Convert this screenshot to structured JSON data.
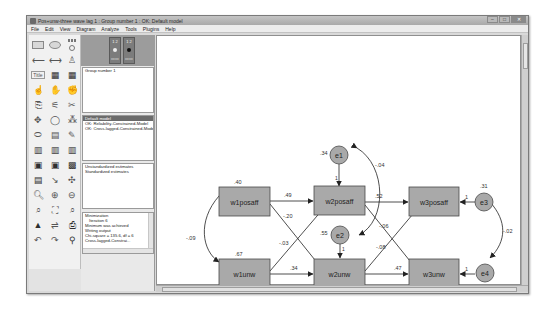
{
  "window": {
    "title": "Pos+unw-three wave lag 1 : Group number 1 : OK: Default model",
    "controls": [
      "minimize",
      "maximize",
      "close"
    ]
  },
  "menubar": {
    "items": [
      "File",
      "Edit",
      "View",
      "Diagram",
      "Analyze",
      "Tools",
      "Plugins",
      "Help"
    ]
  },
  "toolbox": {
    "tools": [
      "draw-observed-variable-icon",
      "draw-unobserved-variable-icon",
      "draw-indicator-icon",
      "draw-path-icon",
      "draw-covariance-icon",
      "add-unique-variable-icon",
      "list-variables-in-model-icon",
      "list-variables-in-dataset-icon",
      "select-one-object-icon",
      "select-all-icon",
      "deselect-all-icon",
      "duplicate-icon",
      "move-icon",
      "erase-icon",
      "change-shape-icon",
      "rotate-icon",
      "reflect-icon",
      "move-parameter-icon",
      "scroll-icon",
      "touch-up-icon",
      "data-files-icon",
      "analysis-properties-icon",
      "calculate-estimates-icon",
      "copy-to-clipboard-icon",
      "text-output-icon",
      "save-icon",
      "object-properties-icon",
      "drag-properties-icon",
      "preserve-symmetries-icon",
      "zoom-in-area-icon",
      "zoom-in-icon",
      "zoom-out-icon",
      "zoom-page-icon",
      "fit-to-page-icon",
      "magnifier-icon",
      "bayesian-icon",
      "multiple-group-icon",
      "print-icon",
      "undo-icon",
      "redo-icon",
      "specification-search-icon"
    ]
  },
  "mode_buttons": [
    {
      "label": "view-input-path-diagram",
      "top": "1 2",
      "active": false
    },
    {
      "label": "view-output-path-diagram",
      "top": "1 2",
      "active": true
    }
  ],
  "panels": {
    "groups": [
      "Group number 1"
    ],
    "models": [
      {
        "label": "Default model",
        "selected": true
      },
      {
        "label": "OK: Reliability-Constrained-Model",
        "selected": false
      },
      {
        "label": "OK: Cross-lagged-Constrained-Model",
        "selected": false
      }
    ],
    "estimates": [
      {
        "label": "Unstandardized estimates",
        "selected": false
      },
      {
        "label": "Standardized estimates",
        "selected": false
      }
    ],
    "computation_log": [
      "Minimization",
      "  Iteration 6",
      "Minimum was achieved",
      "Writing output",
      "Chi-square = 135.6, df = 6",
      "Cross-lagged-Constrai..."
    ]
  },
  "diagram": {
    "observed": [
      {
        "id": "w1posaff",
        "label": "w1posaff",
        "value": ".40"
      },
      {
        "id": "w2posaff",
        "label": "w2posaff",
        "value": ""
      },
      {
        "id": "w3posaff",
        "label": "w3posaff",
        "value": ""
      },
      {
        "id": "w1unw",
        "label": "w1unw",
        "value": ".67"
      },
      {
        "id": "w2unw",
        "label": "w2unw",
        "value": ""
      },
      {
        "id": "w3unw",
        "label": "w3unw",
        "value": ""
      }
    ],
    "errors": [
      {
        "id": "e1",
        "label": "e1",
        "value": ".34"
      },
      {
        "id": "e2",
        "label": "e2",
        "value": ".55"
      },
      {
        "id": "e3",
        "label": "e3",
        "value": ".31"
      },
      {
        "id": "e4",
        "label": "e4",
        "value": ".47"
      }
    ],
    "paths": [
      {
        "from": "w1posaff",
        "to": "w2posaff",
        "value": ".49"
      },
      {
        "from": "w1posaff",
        "to": "w2unw",
        "value": "-.20"
      },
      {
        "from": "w1unw",
        "to": "w2posaff",
        "value": "-.03"
      },
      {
        "from": "w1unw",
        "to": "w2unw",
        "value": ".34"
      },
      {
        "from": "w2posaff",
        "to": "w3posaff",
        "value": ".52"
      },
      {
        "from": "w2posaff",
        "to": "w3unw",
        "value": "-.06"
      },
      {
        "from": "w2unw",
        "to": "w3posaff",
        "value": "-.08"
      },
      {
        "from": "w2unw",
        "to": "w3unw",
        "value": ".47"
      },
      {
        "from": "e1",
        "to": "w2posaff",
        "value": "1"
      },
      {
        "from": "e2",
        "to": "w2unw",
        "value": "1"
      },
      {
        "from": "e3",
        "to": "w3posaff",
        "value": "1"
      },
      {
        "from": "e4",
        "to": "w3unw",
        "value": "1"
      }
    ],
    "covariances": [
      {
        "between": [
          "w1posaff",
          "w1unw"
        ],
        "value": "-.09"
      },
      {
        "between": [
          "e1",
          "e2"
        ],
        "value": "-.04"
      },
      {
        "between": [
          "e3",
          "e4"
        ],
        "value": "-.02"
      }
    ]
  },
  "colors": {
    "box_fill": "#a9a9a9",
    "box_stroke": "#4a4a4a",
    "circle_fill": "#a9a9a9",
    "line": "#2a2a2a"
  }
}
